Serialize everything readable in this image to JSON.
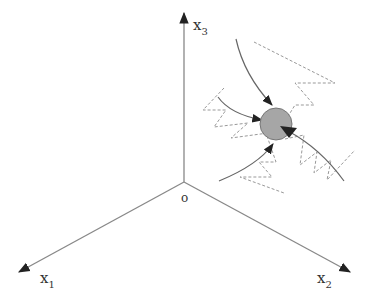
{
  "diagram": {
    "type": "3d-coordinate-system",
    "origin_label": "o",
    "axes": [
      {
        "id": "x1",
        "label": "x",
        "subscript": "1"
      },
      {
        "id": "x2",
        "label": "x",
        "subscript": "2"
      },
      {
        "id": "x3",
        "label": "x",
        "subscript": "3"
      }
    ],
    "particle": {
      "description": "gray circle with incoming curved trajectories and dashed zigzag paths",
      "fill": "#a6a6a6"
    },
    "colors": {
      "axis": "#888888",
      "arrowhead": "#222222",
      "trajectory": "#666666",
      "dashed_path": "#999999",
      "particle_fill": "#a6a6a6",
      "particle_stroke": "#777777"
    }
  }
}
